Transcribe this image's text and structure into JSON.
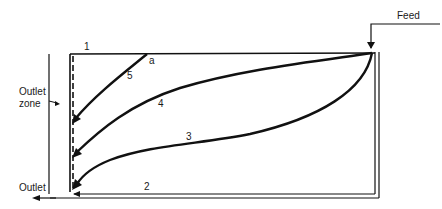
{
  "diagram": {
    "type": "settling tank flow paths",
    "labels": {
      "feed": "Feed",
      "outlet": "Outlet",
      "outlet_zone_line1": "Outlet",
      "outlet_zone_line2": "zone",
      "point_a": "a"
    },
    "flow_paths": [
      {
        "id": "1",
        "label": "1",
        "description": "surface path along top"
      },
      {
        "id": "2",
        "label": "2",
        "description": "bottom path along floor"
      },
      {
        "id": "3",
        "label": "3",
        "description": "lower curved path"
      },
      {
        "id": "4",
        "label": "4",
        "description": "middle curved path"
      },
      {
        "id": "5",
        "label": "5",
        "description": "short path from point a"
      }
    ],
    "colors": {
      "line": "#111111",
      "background": "#ffffff"
    }
  }
}
